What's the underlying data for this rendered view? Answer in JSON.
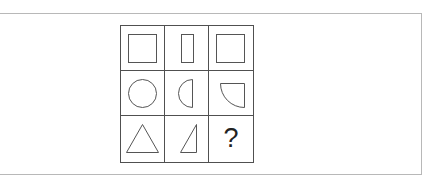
{
  "puzzle": {
    "type": "3x3 shape matrix",
    "stroke_color": "#555555",
    "rows": [
      [
        {
          "shape": "square-icon",
          "description": "square"
        },
        {
          "shape": "narrow-rectangle-icon",
          "description": "narrow vertical rectangle"
        },
        {
          "shape": "square-icon",
          "description": "square"
        }
      ],
      [
        {
          "shape": "circle-icon",
          "description": "circle"
        },
        {
          "shape": "half-circle-icon",
          "description": "left half circle"
        },
        {
          "shape": "quarter-circle-icon",
          "description": "quarter circle"
        }
      ],
      [
        {
          "shape": "triangle-icon",
          "description": "triangle"
        },
        {
          "shape": "right-triangle-icon",
          "description": "half triangle"
        },
        {
          "shape": "question-mark",
          "description": "?"
        }
      ]
    ],
    "missing_label": "?"
  }
}
